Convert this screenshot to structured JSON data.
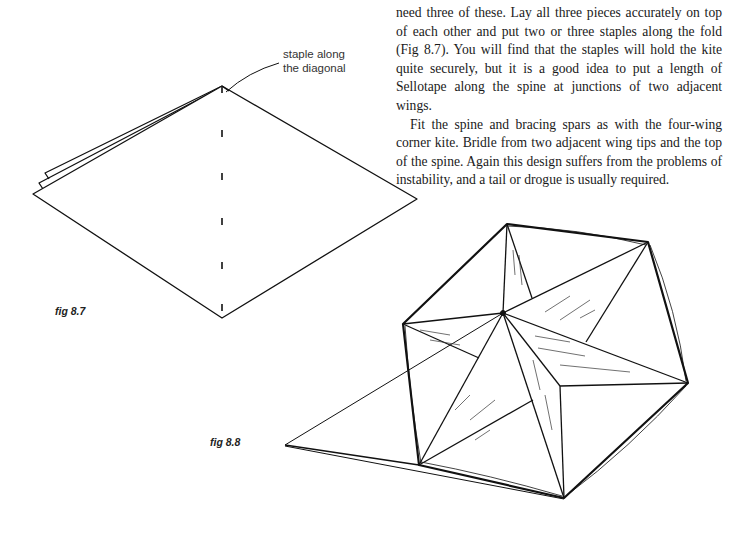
{
  "body_text": {
    "paragraph_1": "need three of these. Lay all three pieces accurately on top of each other and put two or three staples along the fold (Fig 8.7). You will find that the staples will hold the kite quite securely, but it is a good idea to put a length of Sellotape along the spine at junctions of two adjacent wings.",
    "paragraph_2": "Fit the spine and bracing spars as with the four-wing corner kite. Bridle from two adjacent wing tips and the top of the spine. Again this design suffers from the problems of instability, and a tail or drogue is usually required."
  },
  "figures": {
    "fig_8_7": {
      "label": "fig 8.7",
      "callout_line_1": "staple along",
      "callout_line_2": "the diagonal"
    },
    "fig_8_8": {
      "label": "fig 8.8"
    }
  }
}
